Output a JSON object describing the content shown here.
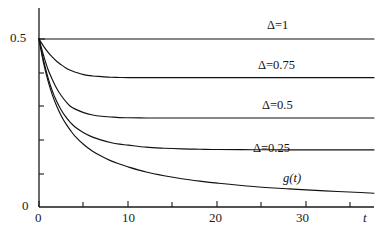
{
  "chart_data": {
    "type": "line",
    "title": "",
    "subtitle": "",
    "xlabel": "t",
    "ylabel": "",
    "xlim": [
      0,
      37.5
    ],
    "ylim": [
      0,
      0.56
    ],
    "grid": false,
    "legend_position": "inline-right",
    "x_ticks_major": [
      0,
      10,
      20,
      30
    ],
    "x_ticks_minor": [
      5,
      15,
      25,
      35
    ],
    "x_tick_labels": [
      "0",
      "10",
      "20",
      "30"
    ],
    "y_ticks_major": [
      0,
      0.5
    ],
    "y_tick_labels": [
      "0",
      "0.5"
    ],
    "y_ticks_minor": [
      0.1,
      0.2,
      0.3,
      0.4
    ],
    "x": [
      0,
      0.5,
      1,
      1.5,
      2,
      2.5,
      3,
      3.5,
      4,
      5,
      6,
      7,
      8,
      9,
      10,
      12,
      14,
      16,
      18,
      20,
      24,
      28,
      32,
      36,
      37.5
    ],
    "series": [
      {
        "name": "Δ=1",
        "label": "Δ=1",
        "plateau": 0.5,
        "color": "#111111",
        "values": [
          0.5,
          0.5,
          0.5,
          0.5,
          0.5,
          0.5,
          0.5,
          0.5,
          0.5,
          0.5,
          0.5,
          0.5,
          0.5,
          0.5,
          0.5,
          0.5,
          0.5,
          0.5,
          0.5,
          0.5,
          0.5,
          0.5,
          0.5,
          0.5,
          0.5
        ]
      },
      {
        "name": "Δ=0.75",
        "label": "Δ=0.75",
        "plateau": 0.385,
        "color": "#111111",
        "values": [
          0.5,
          0.479,
          0.461,
          0.446,
          0.433,
          0.423,
          0.414,
          0.407,
          0.402,
          0.394,
          0.39,
          0.388,
          0.386,
          0.3855,
          0.385,
          0.385,
          0.385,
          0.385,
          0.385,
          0.385,
          0.385,
          0.385,
          0.385,
          0.385,
          0.385
        ]
      },
      {
        "name": "Δ=0.5",
        "label": "Δ=0.5",
        "plateau": 0.265,
        "color": "#111111",
        "values": [
          0.5,
          0.452,
          0.41,
          0.379,
          0.352,
          0.331,
          0.314,
          0.3,
          0.292,
          0.281,
          0.274,
          0.27,
          0.268,
          0.266,
          0.2655,
          0.265,
          0.265,
          0.265,
          0.265,
          0.265,
          0.265,
          0.265,
          0.265,
          0.265,
          0.265
        ]
      },
      {
        "name": "Δ=0.25",
        "label": "Δ=0.25",
        "plateau": 0.17,
        "color": "#111111",
        "values": [
          0.5,
          0.437,
          0.386,
          0.345,
          0.313,
          0.288,
          0.268,
          0.252,
          0.239,
          0.221,
          0.208,
          0.199,
          0.192,
          0.187,
          0.184,
          0.178,
          0.175,
          0.173,
          0.172,
          0.171,
          0.1705,
          0.17,
          0.17,
          0.17,
          0.17
        ]
      },
      {
        "name": "g(t)",
        "label": "g(t)",
        "plateau": 0.02,
        "color": "#111111",
        "values": [
          0.5,
          0.43,
          0.376,
          0.333,
          0.299,
          0.271,
          0.248,
          0.229,
          0.212,
          0.186,
          0.166,
          0.151,
          0.138,
          0.128,
          0.119,
          0.104,
          0.093,
          0.084,
          0.077,
          0.071,
          0.061,
          0.054,
          0.048,
          0.043,
          0.041
        ]
      }
    ],
    "annotations": [
      {
        "text": "Δ=1",
        "x": 30.5,
        "y": 0.525
      },
      {
        "text": "Δ=0.75",
        "x": 29.5,
        "y": 0.41
      },
      {
        "text": "Δ=0.5",
        "x": 30.0,
        "y": 0.295
      },
      {
        "text": "Δ=0.25",
        "x": 29.0,
        "y": 0.2
      },
      {
        "text": "g(t)",
        "x": 32.0,
        "y": 0.115
      }
    ]
  },
  "axes": {
    "x_title": "t",
    "y_top_label": "0.5",
    "y_bottom_label": "0",
    "x_tick_0": "0",
    "x_tick_10": "10",
    "x_tick_20": "20",
    "x_tick_30": "30"
  },
  "labels": {
    "delta_1": "Δ=1",
    "delta_075": "Δ=0.75",
    "delta_05": "Δ=0.5",
    "delta_025": "Δ=0.25",
    "g_of_t": "g(t)"
  }
}
